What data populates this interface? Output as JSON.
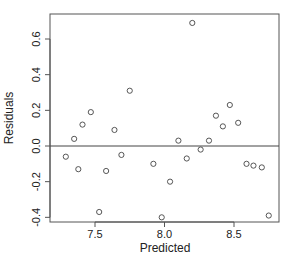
{
  "chart_data": {
    "type": "scatter",
    "title": "",
    "xlabel": "Predicted",
    "ylabel": "Residuals",
    "xlim": [
      7.22,
      8.8
    ],
    "ylim": [
      -0.45,
      0.75
    ],
    "x_ticks": [
      7.5,
      8.0,
      8.5
    ],
    "x_tick_labels": [
      "7.5",
      "8.0",
      "8.5"
    ],
    "y_ticks": [
      -0.4,
      -0.2,
      0.0,
      0.2,
      0.4,
      0.6
    ],
    "y_tick_labels": [
      "-0.4",
      "-0.2",
      "0.0",
      "0.2",
      "0.4",
      "0.6"
    ],
    "reference_line": {
      "y": 0.0
    },
    "grid": false,
    "marker": "open-circle",
    "points": [
      {
        "x": 7.29,
        "y": -0.06
      },
      {
        "x": 7.35,
        "y": 0.04
      },
      {
        "x": 7.38,
        "y": -0.13
      },
      {
        "x": 7.41,
        "y": 0.12
      },
      {
        "x": 7.47,
        "y": 0.19
      },
      {
        "x": 7.53,
        "y": -0.37
      },
      {
        "x": 7.58,
        "y": -0.14
      },
      {
        "x": 7.64,
        "y": 0.09
      },
      {
        "x": 7.69,
        "y": -0.05
      },
      {
        "x": 7.75,
        "y": 0.31
      },
      {
        "x": 7.92,
        "y": -0.1
      },
      {
        "x": 7.98,
        "y": -0.4
      },
      {
        "x": 8.04,
        "y": -0.2
      },
      {
        "x": 8.1,
        "y": 0.03
      },
      {
        "x": 8.16,
        "y": -0.07
      },
      {
        "x": 8.2,
        "y": 0.69
      },
      {
        "x": 8.26,
        "y": -0.02
      },
      {
        "x": 8.32,
        "y": 0.03
      },
      {
        "x": 8.37,
        "y": 0.17
      },
      {
        "x": 8.42,
        "y": 0.11
      },
      {
        "x": 8.47,
        "y": 0.23
      },
      {
        "x": 8.53,
        "y": 0.13
      },
      {
        "x": 8.59,
        "y": -0.1
      },
      {
        "x": 8.64,
        "y": -0.11
      },
      {
        "x": 8.7,
        "y": -0.12
      },
      {
        "x": 8.75,
        "y": -0.39
      }
    ]
  },
  "colors": {
    "axis": "#555555",
    "point": "#444444",
    "text": "#222222"
  }
}
